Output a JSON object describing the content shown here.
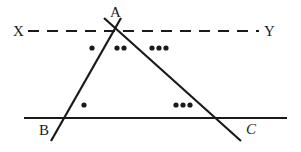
{
  "figure": {
    "type": "geometry-diagram",
    "colors": {
      "stroke": "#1a1a1a",
      "label": "#1a1a1a",
      "background": "#ffffff"
    },
    "labels": {
      "A": "A",
      "B": "B",
      "C": "C",
      "X": "X",
      "Y": "Y"
    },
    "points": {
      "A": {
        "x": 113,
        "y": 28
      },
      "B": {
        "x": 65,
        "y": 118
      },
      "C": {
        "x": 222,
        "y": 118
      }
    },
    "lines": [
      {
        "name": "line-XY",
        "style": "dashed",
        "x1": 28,
        "y1": 31,
        "x2": 259,
        "y2": 31,
        "dash": "11 8",
        "width": 2
      },
      {
        "name": "line-BC",
        "style": "solid",
        "x1": 24,
        "y1": 118,
        "x2": 287,
        "y2": 118,
        "width": 2.4
      },
      {
        "name": "line-AB",
        "style": "solid",
        "x1": 121,
        "y1": 18,
        "x2": 51,
        "y2": 141,
        "width": 2.2
      },
      {
        "name": "line-AC",
        "style": "solid",
        "x1": 104,
        "y1": 18,
        "x2": 241,
        "y2": 141,
        "width": 2.2
      }
    ],
    "angle_marks": [
      {
        "name": "mark-angle-XAB",
        "count": 1,
        "radius": 2.6,
        "dots": [
          {
            "x": 92,
            "y": 48
          }
        ]
      },
      {
        "name": "mark-angle-BAC",
        "count": 2,
        "radius": 2.6,
        "dots": [
          {
            "x": 117,
            "y": 48
          },
          {
            "x": 124,
            "y": 48
          }
        ]
      },
      {
        "name": "mark-angle-CAY",
        "count": 3,
        "radius": 2.6,
        "dots": [
          {
            "x": 152,
            "y": 48
          },
          {
            "x": 159,
            "y": 48
          },
          {
            "x": 166,
            "y": 48
          }
        ]
      },
      {
        "name": "mark-angle-ABC",
        "count": 1,
        "radius": 2.6,
        "dots": [
          {
            "x": 84,
            "y": 105
          }
        ]
      },
      {
        "name": "mark-angle-ACB",
        "count": 3,
        "radius": 2.6,
        "dots": [
          {
            "x": 176,
            "y": 105
          },
          {
            "x": 183,
            "y": 105
          },
          {
            "x": 190,
            "y": 105
          }
        ]
      }
    ]
  }
}
